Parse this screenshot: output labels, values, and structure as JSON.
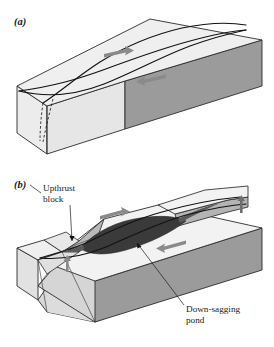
{
  "figure": {
    "background_color": "#ffffff"
  },
  "panels": [
    {
      "id": "panel-a",
      "label": "(a)",
      "description": "Undeformed block with sigmoidal fault traces and opposing shear arrows",
      "arrows": [
        {
          "name": "shear-arrow-top",
          "direction": "right",
          "color": "#8a8a8a"
        },
        {
          "name": "shear-arrow-bottom",
          "direction": "left",
          "color": "#8a8a8a"
        }
      ]
    },
    {
      "id": "panel-b",
      "label": "(b)",
      "description": "Deformed block showing upthrust blocks and down-sagging pond",
      "callouts": [
        {
          "name": "upthrust-block-callout",
          "line1": "Upthrust",
          "line2": "block"
        },
        {
          "name": "down-sagging-pond-callout",
          "line1": "Down-sagging",
          "line2": "pond"
        }
      ],
      "arrows": [
        {
          "name": "shear-arrow-top",
          "direction": "right",
          "color": "#8a8a8a"
        },
        {
          "name": "shear-arrow-bottom",
          "direction": "left",
          "color": "#8a8a8a"
        },
        {
          "name": "uplift-arrow-left",
          "direction": "up",
          "color": "#8a8a8a"
        },
        {
          "name": "uplift-arrow-right",
          "direction": "up",
          "color": "#6e6e6e"
        }
      ]
    }
  ],
  "colors": {
    "top_face": "#efefef",
    "front_face": "#ececec",
    "right_face": "#9b9b9b",
    "side_shaded": "#c9c9c9",
    "wedge_mid": "#b4b4b4",
    "pond_dark": "#3a3a3a",
    "pond_mid": "#6a6a6a",
    "outline": "#2b2b2b",
    "text": "#1a1a1a",
    "arrow": "#8a8a8a"
  }
}
